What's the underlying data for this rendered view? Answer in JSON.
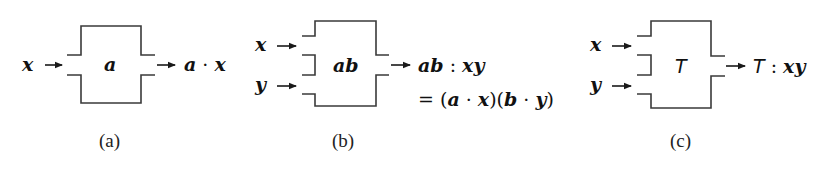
{
  "panels": [
    {
      "id": "a",
      "caption": "(a)",
      "inputs": [
        "x"
      ],
      "box_label": "a",
      "output": {
        "head": "a",
        "op": " · ",
        "tail": "x"
      }
    },
    {
      "id": "b",
      "caption": "(b)",
      "inputs": [
        "x",
        "y"
      ],
      "box_label": "ab",
      "output": {
        "head": "ab",
        "op": " : ",
        "tail": "xy"
      },
      "equation": {
        "eq": "= (",
        "a": "a",
        "dot1": " · ",
        "x": "x",
        "mid": ")(",
        "b": "b",
        "dot2": " · ",
        "y": "y",
        "close": ")"
      }
    },
    {
      "id": "c",
      "caption": "(c)",
      "inputs": [
        "x",
        "y"
      ],
      "box_label": "T",
      "output": {
        "head": "T",
        "op": " : ",
        "tail": "xy"
      }
    }
  ],
  "colors": {
    "stroke": "#3a3a3a",
    "text": "#111111",
    "background": "#ffffff"
  }
}
